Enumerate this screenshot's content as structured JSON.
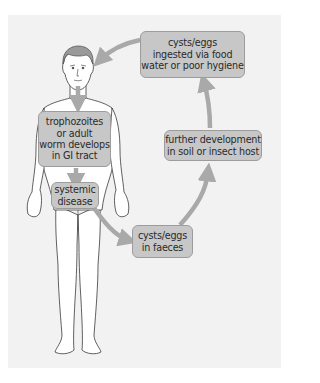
{
  "diagram": {
    "type": "life-cycle",
    "colors": {
      "panel_background": "#f2f2f2",
      "box_fill": "#c7c7c7",
      "box_border": "#9c9c9c",
      "arrow": "#a9a9a9",
      "text": "#2a2a2a"
    },
    "nodes": [
      {
        "id": "ingested",
        "label": "cysts/eggs\ningested via food\nwater or poor hygiene"
      },
      {
        "id": "gi_tract",
        "label": "trophozoites\nor adult\nworm develops\nin GI tract"
      },
      {
        "id": "systemic",
        "label": "systemic\ndisease"
      },
      {
        "id": "faeces",
        "label": "cysts/eggs\nin faeces"
      },
      {
        "id": "further",
        "label": "further development\nin soil or insect host"
      }
    ],
    "edges": [
      {
        "from": "ingested",
        "to": "human-head"
      },
      {
        "from": "human-head",
        "to": "gi_tract"
      },
      {
        "from": "gi_tract",
        "to": "systemic"
      },
      {
        "from": "systemic",
        "to": "faeces"
      },
      {
        "from": "faeces",
        "to": "further"
      },
      {
        "from": "further",
        "to": "ingested"
      }
    ]
  }
}
